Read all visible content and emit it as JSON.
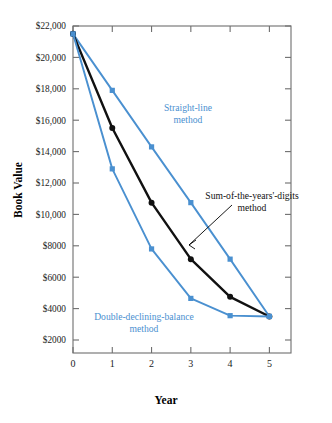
{
  "chart_data": {
    "type": "line",
    "title": "",
    "xlabel": "Year",
    "ylabel": "Book Value",
    "x": [
      0,
      1,
      2,
      3,
      4,
      5
    ],
    "xlim": [
      0,
      5
    ],
    "ylim": [
      1000,
      22000
    ],
    "grid": false,
    "legend_position": "inline-annotations",
    "xticklabels": [
      "0",
      "1",
      "2",
      "3",
      "4",
      "5"
    ],
    "yticklabels": [
      "$22,000",
      "$20,000",
      "$18,000",
      "$16,000",
      "$14,000",
      "$12,000",
      "$10,000",
      "$8000",
      "$6000",
      "$4000",
      "$2000"
    ],
    "ytickvalues": [
      22000,
      20000,
      18000,
      16000,
      14000,
      12000,
      10000,
      8000,
      6000,
      4000,
      2000
    ],
    "series": [
      {
        "name": "Straight-line method",
        "color": "#4a90d0",
        "marker": "square",
        "values": [
          21500,
          17900,
          14300,
          10750,
          7150,
          3500
        ]
      },
      {
        "name": "Sum-of-the-years'-digits method",
        "color": "#111111",
        "marker": "circle",
        "values": [
          21500,
          15500,
          10750,
          7150,
          4750,
          3500
        ]
      },
      {
        "name": "Double-declining-balance method",
        "color": "#4a90d0",
        "marker": "square",
        "values": [
          21500,
          12900,
          7800,
          4650,
          3550,
          3500
        ]
      }
    ],
    "annotations": [
      {
        "id": "straight-line",
        "text_line1": "Straight-line",
        "text_line2": "method",
        "color": "#4a90d0",
        "x": 188,
        "y": 111
      },
      {
        "id": "sum-of-years-digits",
        "text_line1": "Sum-of-the-years'-digits",
        "text_line2": "method",
        "color": "#111111",
        "x": 252,
        "y": 199
      },
      {
        "id": "double-declining-balance",
        "text_line1": "Double-declining-balance",
        "text_line2": "method",
        "color": "#4a90d0",
        "x": 144,
        "y": 320
      }
    ]
  },
  "colors": {
    "series_blue": "#4a90d0",
    "series_black": "#111111",
    "axis": "#6e6e6e",
    "background": "#ffffff"
  }
}
